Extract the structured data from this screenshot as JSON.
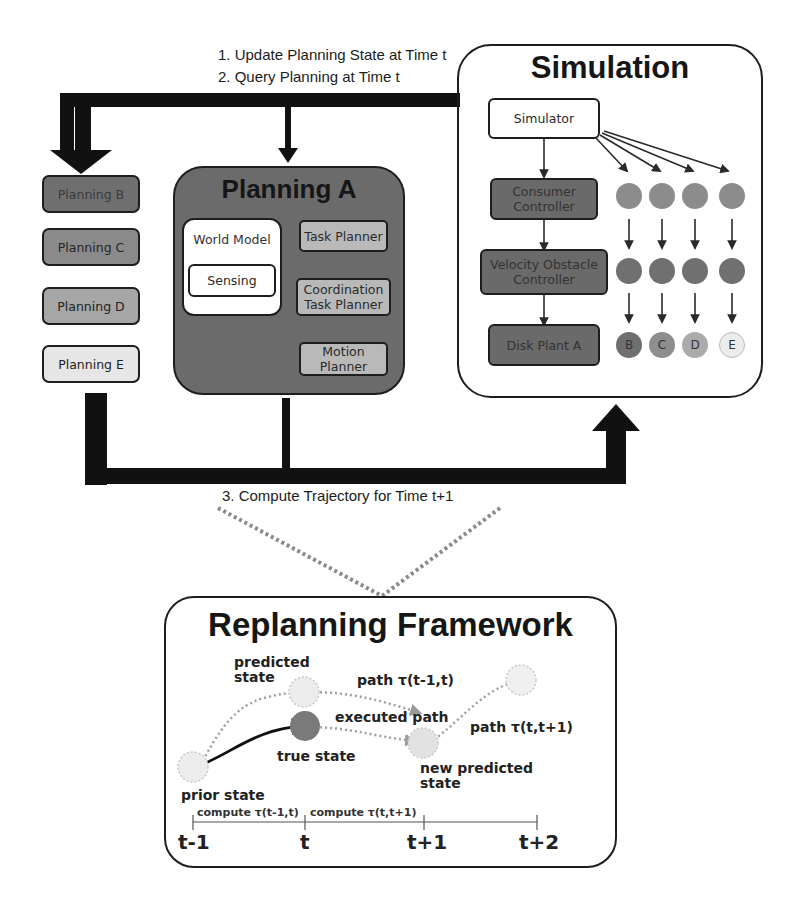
{
  "steps": {
    "step1": "1. Update Planning State at Time t",
    "step2": "2. Query Planning at Time t",
    "step3": "3. Compute Trajectory for Time t+1"
  },
  "planners": {
    "others": [
      {
        "label": "Planning B",
        "color": "#6f6f6f"
      },
      {
        "label": "Planning C",
        "color": "#8a8a8a"
      },
      {
        "label": "Planning D",
        "color": "#a6a6a6"
      },
      {
        "label": "Planning E",
        "color": "#e6e6e6"
      }
    ],
    "planning_a": {
      "title": "Planning A",
      "color": "#6b6b6b",
      "world_model": "World Model",
      "sensing": "Sensing",
      "task_planner": "Task Planner",
      "coordination_task_planner": "Coordination Task Planner",
      "motion_planner": "Motion Planner",
      "inner_box_color": "#b9b9b9"
    }
  },
  "simulation": {
    "title": "Simulation",
    "simulator": "Simulator",
    "consumer_controller": "Consumer Controller",
    "velocity_obstacle_controller": "Velocity Obstacle Controller",
    "disk_plant_a": "Disk Plant A",
    "box_color": "#6a6a6a",
    "row1_color": "#8c8c8c",
    "row2_color": "#707070",
    "agents": [
      {
        "label": "B",
        "color": "#6f6f6f"
      },
      {
        "label": "C",
        "color": "#8e8e8e"
      },
      {
        "label": "D",
        "color": "#ababab"
      },
      {
        "label": "E",
        "color": "#ececec"
      }
    ]
  },
  "replanning": {
    "title": "Replanning Framework",
    "labels": {
      "predicted_state": "predicted state",
      "path_prev": "path τ(t-1,t)",
      "executed_path": "executed path",
      "path_next": "path τ(t,t+1)",
      "true_state": "true state",
      "new_predicted_state": "new predicted state",
      "prior_state": "prior state"
    },
    "timeline": {
      "ticks": [
        "t-1",
        "t",
        "t+1",
        "t+2"
      ],
      "compute_1": "compute τ(t-1,t)",
      "compute_2": "compute τ(t,t+1)"
    }
  }
}
